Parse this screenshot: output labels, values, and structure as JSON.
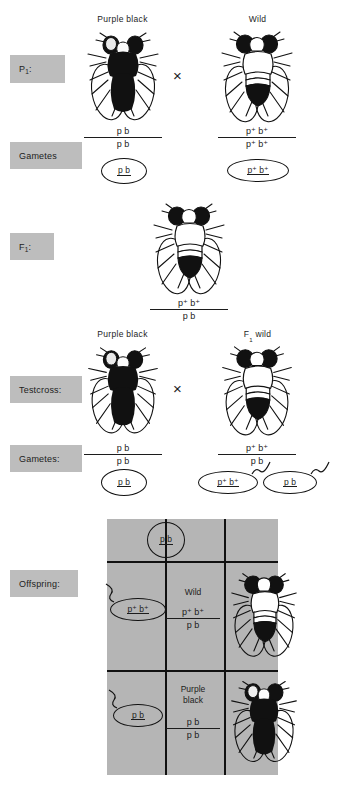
{
  "figure": {
    "cross_symbol": "×"
  },
  "colors": {
    "label_box": "#bdbdbd",
    "grid_background": "#b5b5b5",
    "ink": "#1c1c1c",
    "page": "#ffffff"
  },
  "stage_labels": [
    {
      "name": "p1",
      "text": "P",
      "sub": "1",
      "suffix": ":"
    },
    {
      "name": "gametes_p1",
      "text": "Gametes",
      "sub": "",
      "suffix": ""
    },
    {
      "name": "f1",
      "text": "F",
      "sub": "1",
      "suffix": ":"
    },
    {
      "name": "testcross",
      "text": "Testcross:",
      "sub": "",
      "suffix": ""
    },
    {
      "name": "gametes_testcross",
      "text": "Gametes:",
      "sub": "",
      "suffix": ""
    },
    {
      "name": "offspring",
      "text": "Offspring:",
      "sub": "",
      "suffix": ""
    }
  ],
  "p1_row": {
    "left_title": "Purple black",
    "right_title": "Wild",
    "left_genotype": {
      "numerator": "p  b",
      "denominator": "p  b"
    },
    "right_genotype": {
      "numerator": "p⁺ b⁺",
      "denominator": "p⁺ b⁺"
    },
    "left_gamete": "p  b",
    "right_gamete": "p⁺ b⁺",
    "left_phenotype": "purple black",
    "right_phenotype": "wild"
  },
  "f1_row": {
    "genotype": {
      "numerator": "p⁺ b⁺",
      "denominator": "p  b"
    },
    "phenotype": "wild"
  },
  "testcross_row": {
    "left_title": "Purple black",
    "right_title": "F₁ wild",
    "right_title_text": "F",
    "right_title_sub": "1",
    "right_title_tail": " wild",
    "left_genotype": {
      "numerator": "p  b",
      "denominator": "p  b"
    },
    "right_genotype": {
      "numerator": "p⁺ b⁺",
      "denominator": "p  b"
    },
    "left_gametes": [
      "p  b"
    ],
    "right_gametes": [
      "p⁺ b⁺",
      "p  b"
    ]
  },
  "offspring_grid": {
    "column_gamete": "p  b",
    "rows": [
      {
        "gamete": "p⁺ b⁺",
        "phenotype": "Wild",
        "phenotype_line2": "",
        "genotype": {
          "numerator": "p⁺ b⁺",
          "denominator": "p  b"
        },
        "fly": "wild"
      },
      {
        "gamete": "p  b",
        "phenotype": "Purple",
        "phenotype_line2": "black",
        "genotype": {
          "numerator": "p  b",
          "denominator": "p  b"
        },
        "fly": "purple-black"
      }
    ]
  },
  "icons": {
    "fly_purple_black": "fly-dark-icon",
    "fly_wild": "fly-wild-icon",
    "gamete_bubble": "gamete-circle-icon",
    "cross": "cross-multiply-icon"
  }
}
